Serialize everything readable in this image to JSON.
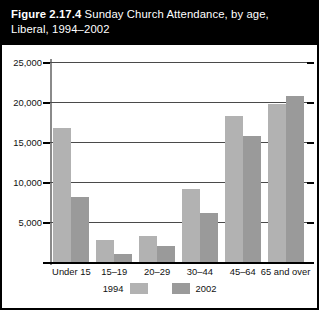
{
  "figure": {
    "number": "Figure 2.17.4",
    "title_rest": " Sunday Church Attendance, by age,",
    "title_line2": "Liberal, 1994–2002"
  },
  "legend": {
    "series_1_label": "1994",
    "series_2_label": "2002"
  },
  "colors": {
    "series_1994": "#b2b2b2",
    "series_2002": "#9a9a9a",
    "title_bar": "#000000",
    "frame": "#000000",
    "gridline": "#4a4a4a"
  },
  "chart_data": {
    "type": "bar",
    "title": "Figure 2.17.4 Sunday Church Attendance, by age, Liberal, 1994–2002",
    "subtitle": "",
    "xlabel": "",
    "ylabel": "",
    "ylim": [
      0,
      25000
    ],
    "yticks": [
      0,
      5000,
      10000,
      15000,
      20000,
      25000
    ],
    "ytick_labels": [
      "",
      "5,000",
      "10,000",
      "15,000",
      "20,000",
      "25,000"
    ],
    "grid": true,
    "legend_position": "bottom",
    "categories": [
      "Under 15",
      "15–19",
      "20–29",
      "30–44",
      "45–64",
      "65 and over"
    ],
    "series": [
      {
        "name": "1994",
        "color": "#b2b2b2",
        "values": [
          16800,
          2800,
          3200,
          9100,
          18200,
          19800
        ]
      },
      {
        "name": "2002",
        "color": "#9a9a9a",
        "values": [
          8100,
          1000,
          2000,
          6100,
          15700,
          20700
        ]
      }
    ]
  }
}
